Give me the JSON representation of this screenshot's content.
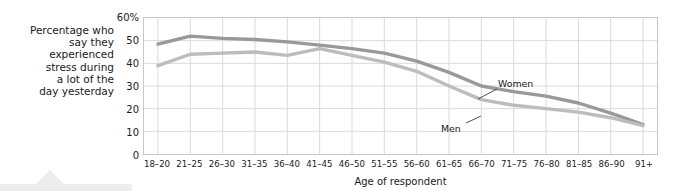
{
  "ylabel_text": "Percentage who say they experienced stress during a lot of the day yesterday",
  "ylabel_lines": [
    "Percentage who",
    "say they",
    "experienced",
    "stress during",
    "a lot of the",
    "day yesterday"
  ],
  "annotations": {
    "women": "Women",
    "men": "Men"
  },
  "colors": {
    "women_line": "#999999",
    "men_line": "#bcbcbc",
    "grid": "#d9d9d9",
    "frame": "#c8c8c8",
    "text": "#1a1a1a",
    "deco": "#ededed"
  },
  "chart_data": {
    "type": "line",
    "title": "",
    "subtitle": "",
    "xlabel": "Age of respondent",
    "ylabel": "Percentage who say they experienced stress during a lot of the day yesterday",
    "categories": [
      "18–20",
      "21–25",
      "26–30",
      "31–35",
      "36–40",
      "41–45",
      "46–50",
      "51–55",
      "56–60",
      "61–65",
      "66–70",
      "71–75",
      "76–80",
      "81–85",
      "86–90",
      "91+"
    ],
    "ylim": [
      0,
      60
    ],
    "yticks": [
      0,
      10,
      20,
      30,
      40,
      50,
      60
    ],
    "ytick_labels": [
      "0",
      "10",
      "20",
      "30",
      "40",
      "50",
      "60%"
    ],
    "grid": true,
    "legend": "annotated-inline",
    "series": [
      {
        "name": "Women",
        "color": "#999999",
        "values": [
          48.5,
          52.0,
          51.0,
          50.5,
          49.5,
          48.0,
          46.5,
          44.5,
          41.0,
          36.0,
          30.0,
          27.5,
          25.5,
          22.5,
          18.0,
          13.0
        ]
      },
      {
        "name": "Men",
        "color": "#bcbcbc",
        "values": [
          39.0,
          44.0,
          44.5,
          45.0,
          43.5,
          46.5,
          43.5,
          40.5,
          36.5,
          30.0,
          24.0,
          21.5,
          20.0,
          18.5,
          16.0,
          12.5
        ]
      }
    ]
  }
}
